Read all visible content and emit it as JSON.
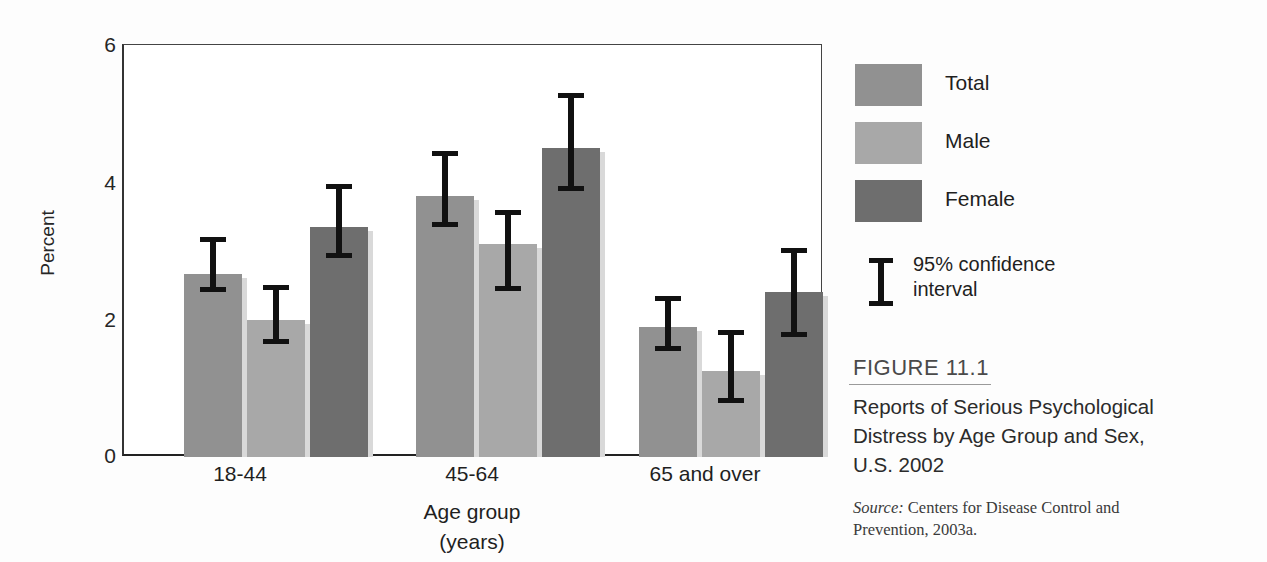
{
  "chart_data": {
    "type": "bar",
    "title": "Reports of Serious Psychological Distress by Age Group and Sex, U.S. 2002",
    "xlabel": "Age group (years)",
    "ylabel": "Percent",
    "ylim": [
      0,
      6
    ],
    "yticks": [
      0,
      2,
      4,
      6
    ],
    "grid": false,
    "legend_position": "right",
    "categories": [
      "18-44",
      "45-64",
      "65 and over"
    ],
    "series": [
      {
        "name": "Total",
        "color": "#919191",
        "values": [
          2.67,
          3.8,
          1.9
        ],
        "ci_low": [
          2.4,
          3.35,
          1.55
        ],
        "ci_high": [
          3.2,
          4.45,
          2.35
        ]
      },
      {
        "name": "Male",
        "color": "#a8a8a8",
        "values": [
          2.0,
          3.1,
          1.25
        ],
        "ci_low": [
          1.65,
          2.42,
          0.78
        ],
        "ci_high": [
          2.5,
          3.6,
          1.85
        ]
      },
      {
        "name": "Female",
        "color": "#6e6e6e",
        "values": [
          3.35,
          4.5,
          2.4
        ],
        "ci_low": [
          2.9,
          3.88,
          1.75
        ],
        "ci_high": [
          3.97,
          5.3,
          3.05
        ]
      }
    ],
    "error_bar_label": "95% confidence interval"
  },
  "axis": {
    "y_label": "Percent",
    "y_tick_labels": [
      "6",
      "4",
      "2",
      "0"
    ],
    "x_label_line1": "Age group",
    "x_label_line2": "(years)",
    "x_group_labels": [
      "18-44",
      "45-64",
      "65 and over"
    ]
  },
  "legend": {
    "items": [
      {
        "label": "Total",
        "color": "#919191"
      },
      {
        "label": "Male",
        "color": "#a8a8a8"
      },
      {
        "label": "Female",
        "color": "#6e6e6e"
      }
    ],
    "ci_label_line1": "95% confidence",
    "ci_label_line2": "interval"
  },
  "caption": {
    "figure_number": "FIGURE 11.1",
    "title": "Reports of Serious Psychological Distress by Age Group and Sex, U.S. 2002",
    "source_word": "Source:",
    "source_text": " Centers for Disease Control and Prevention, 2003a."
  }
}
